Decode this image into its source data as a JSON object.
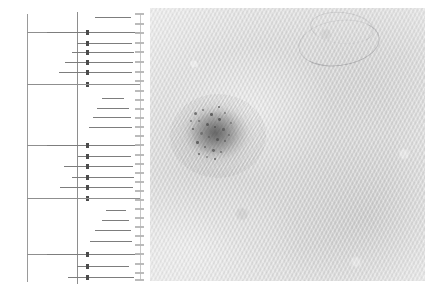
{
  "figure": {
    "background_color": "#ffffff",
    "width": 438,
    "height": 294,
    "panels": [
      {
        "id": "forest-panel",
        "kind": "forest-plot",
        "label": "Forest plot of pooled diagnostic estimates"
      },
      {
        "id": "derm-panel",
        "kind": "dermoscopy-photo",
        "label": "Dermoscopic image of pigmented skin lesion"
      }
    ]
  },
  "forest_panel": {
    "title": "",
    "axis": {
      "null_line_x_pct": 52.7,
      "left_spine_x_pct": 18.5,
      "line_color": "#8e8e8e"
    },
    "column_labels": {
      "study": "",
      "estimate": "",
      "weight": ""
    },
    "group_rule_color": "#8f8f8f",
    "marker_color": "#4b4b4b",
    "ci_color": "#7d7d7d"
  },
  "derm_panel": {
    "caption": "",
    "background_color": "#dcdcdc",
    "lesion": {
      "name": "pigmented-lesion",
      "pigment_color": "#5a5a5a",
      "globule_color": "#4a4a4a"
    },
    "artifact": {
      "name": "terminal-hair",
      "color": "#787880"
    }
  },
  "chart_data": {
    "type": "forest",
    "title": "",
    "subtitle": "",
    "xlabel": "",
    "ylabel": "",
    "xlim": [
      0.0,
      1.0
    ],
    "grid": false,
    "legend": "none",
    "null_value": 0.527,
    "note": "Text labels in the source figure are rendered below legible resolution; only geometry is recoverable.",
    "groups": [
      {
        "name": "",
        "rule_y": 32,
        "rows": [
          {
            "label": "",
            "est": 0.72,
            "lo": 0.6,
            "hi": 0.92,
            "y": 17,
            "has_marker": false,
            "label_bar": {
              "x": 58,
              "w": 22
            }
          },
          {
            "label": "",
            "est": 0.527,
            "lo": 0.175,
            "hi": 0.96,
            "y": 32,
            "has_marker": true,
            "label_bar": null
          },
          {
            "label": "",
            "est": 0.527,
            "lo": 0.44,
            "hi": 0.93,
            "y": 43,
            "has_marker": true,
            "label_bar": {
              "x": 62,
              "w": 16
            }
          },
          {
            "label": "",
            "est": 0.527,
            "lo": 0.4,
            "hi": 0.95,
            "y": 52,
            "has_marker": true,
            "label_bar": {
              "x": 60,
              "w": 18
            }
          },
          {
            "label": "",
            "est": 0.527,
            "lo": 0.34,
            "hi": 0.94,
            "y": 62,
            "has_marker": true,
            "label_bar": {
              "x": 50,
              "w": 27
            }
          },
          {
            "label": "",
            "est": 0.527,
            "lo": 0.28,
            "hi": 0.93,
            "y": 72,
            "has_marker": true,
            "label_bar": {
              "x": 42,
              "w": 35
            }
          },
          {
            "label": "",
            "est": 0.527,
            "lo": 0.175,
            "hi": 0.96,
            "y": 84,
            "has_marker": true,
            "label_bar": null
          }
        ]
      },
      {
        "name": "",
        "rule_y": 84,
        "rows": [
          {
            "label": "",
            "est": 0.74,
            "lo": 0.66,
            "hi": 0.86,
            "y": 98,
            "has_marker": false,
            "label_bar": {
              "x": 96,
              "w": 14
            }
          },
          {
            "label": "",
            "est": 0.72,
            "lo": 0.62,
            "hi": 0.9,
            "y": 108,
            "has_marker": false,
            "label_bar": {
              "x": 90,
              "w": 18
            }
          },
          {
            "label": "",
            "est": 0.7,
            "lo": 0.58,
            "hi": 0.92,
            "y": 117,
            "has_marker": false,
            "label_bar": {
              "x": 86,
              "w": 22
            }
          },
          {
            "label": "",
            "est": 0.68,
            "lo": 0.55,
            "hi": 0.93,
            "y": 127,
            "has_marker": false,
            "label_bar": {
              "x": 80,
              "w": 26
            }
          }
        ]
      },
      {
        "name": "",
        "rule_y": 145,
        "rows": [
          {
            "label": "",
            "est": 0.527,
            "lo": 0.175,
            "hi": 0.96,
            "y": 145,
            "has_marker": true,
            "label_bar": null
          },
          {
            "label": "",
            "est": 0.527,
            "lo": 0.45,
            "hi": 0.92,
            "y": 156,
            "has_marker": true,
            "label_bar": {
              "x": 66,
              "w": 12
            }
          },
          {
            "label": "",
            "est": 0.527,
            "lo": 0.33,
            "hi": 0.94,
            "y": 166,
            "has_marker": true,
            "label_bar": {
              "x": 48,
              "w": 30
            }
          },
          {
            "label": "",
            "est": 0.527,
            "lo": 0.4,
            "hi": 0.95,
            "y": 177,
            "has_marker": true,
            "label_bar": {
              "x": 58,
              "w": 20
            }
          },
          {
            "label": "",
            "est": 0.527,
            "lo": 0.29,
            "hi": 0.94,
            "y": 187,
            "has_marker": true,
            "label_bar": {
              "x": 42,
              "w": 35
            }
          },
          {
            "label": "",
            "est": 0.527,
            "lo": 0.175,
            "hi": 0.96,
            "y": 198,
            "has_marker": true,
            "label_bar": null
          }
        ]
      },
      {
        "name": "",
        "rule_y": 198,
        "rows": [
          {
            "label": "",
            "est": 0.78,
            "lo": 0.7,
            "hi": 0.88,
            "y": 210,
            "has_marker": false,
            "label_bar": {
              "x": 100,
              "w": 12
            }
          },
          {
            "label": "",
            "est": 0.76,
            "lo": 0.66,
            "hi": 0.9,
            "y": 220,
            "has_marker": false,
            "label_bar": {
              "x": 94,
              "w": 16
            }
          },
          {
            "label": "",
            "est": 0.72,
            "lo": 0.6,
            "hi": 0.92,
            "y": 230,
            "has_marker": false,
            "label_bar": {
              "x": 86,
              "w": 22
            }
          },
          {
            "label": "",
            "est": 0.7,
            "lo": 0.56,
            "hi": 0.93,
            "y": 241,
            "has_marker": false,
            "label_bar": {
              "x": 80,
              "w": 27
            }
          }
        ]
      },
      {
        "name": "",
        "rule_y": 254,
        "rows": [
          {
            "label": "",
            "est": 0.527,
            "lo": 0.175,
            "hi": 0.96,
            "y": 254,
            "has_marker": true,
            "label_bar": null
          },
          {
            "label": "",
            "est": 0.527,
            "lo": 0.44,
            "hi": 0.9,
            "y": 266,
            "has_marker": true,
            "label_bar": {
              "x": 62,
              "w": 14
            }
          },
          {
            "label": "",
            "est": 0.527,
            "lo": 0.36,
            "hi": 0.95,
            "y": 277,
            "has_marker": true,
            "label_bar": {
              "x": 52,
              "w": 24
            }
          }
        ]
      }
    ],
    "stat_dash_rows": [
      14,
      24,
      33,
      43,
      52,
      62,
      72,
      81,
      91,
      100,
      109,
      118,
      127,
      136,
      145,
      155,
      164,
      173,
      182,
      191,
      200,
      209,
      218,
      227,
      236,
      245,
      254,
      264,
      273,
      280
    ],
    "right_text_column": {
      "x_pct": 88,
      "legible": false,
      "description": "column of effect-size / weight values, sub-pixel text"
    }
  }
}
